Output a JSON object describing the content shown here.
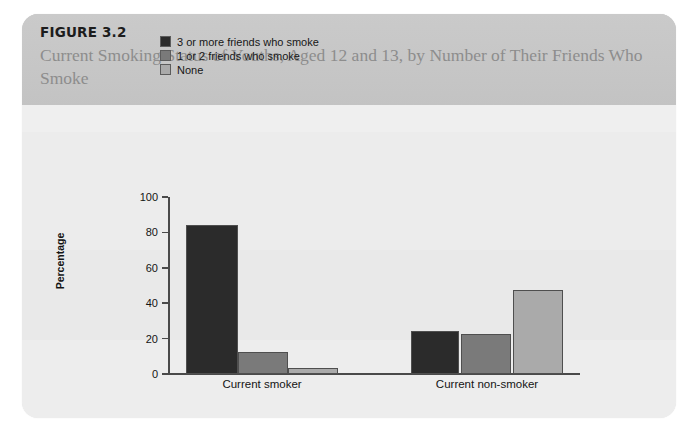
{
  "figure": {
    "number": "FIGURE 3.2",
    "title": "Current Smoking Status of Youths, Aged 12 and 13, by Number of Their Friends Who Smoke"
  },
  "colors": {
    "header_band": "#c9c9c9",
    "card_background": "#efefef",
    "series_dark": "#2b2b2b",
    "series_medium": "#7a7a7a",
    "series_light": "#aaaaaa",
    "axis": "#4a4a4a",
    "title_text": "#8d8d8d"
  },
  "chart_data": {
    "type": "bar",
    "title": "Current Smoking Status of Youths, Aged 12 and 13, by Number of Their Friends Who Smoke",
    "xlabel": "",
    "ylabel": "Percentage",
    "ylim": [
      0,
      100
    ],
    "yticks": [
      0,
      20,
      40,
      60,
      80,
      100
    ],
    "grid": false,
    "legend_position": "top-left",
    "categories": [
      "Current smoker",
      "Current non-smoker"
    ],
    "series": [
      {
        "name": "3 or more friends who smoke",
        "color": "#2b2b2b",
        "values": [
          84,
          24.5
        ]
      },
      {
        "name": "1 or 2 friends who smoke",
        "color": "#7a7a7a",
        "values": [
          12.5,
          22.5
        ]
      },
      {
        "name": "None",
        "color": "#aaaaaa",
        "values": [
          3.5,
          47.5
        ]
      }
    ]
  }
}
